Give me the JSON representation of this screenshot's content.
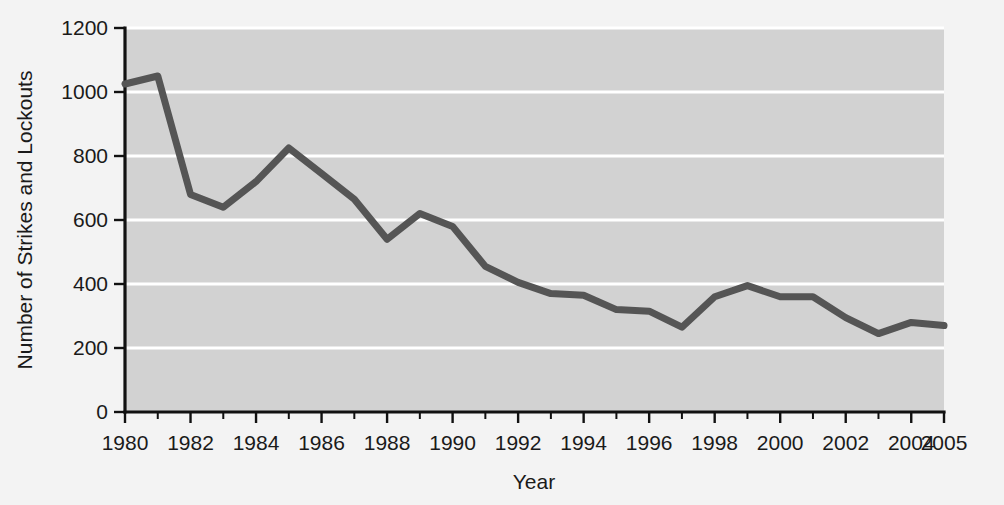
{
  "figure": {
    "background_color": "#f3f3f3",
    "plot_background_color": "#d2d2d2",
    "gridline_color": "#ffffff",
    "axis_color": "#111111",
    "line_color": "#555555"
  },
  "chart_data": {
    "type": "line",
    "title": "",
    "xlabel": "Year",
    "ylabel": "Number of Strikes and Lockouts",
    "xlim": [
      1980,
      2005
    ],
    "ylim": [
      0,
      1200
    ],
    "grid": true,
    "grid_axis": "y",
    "legend": false,
    "ytick_labels": [
      "0",
      "200",
      "400",
      "600",
      "800",
      "1000",
      "1200"
    ],
    "yticks": [
      0,
      200,
      400,
      600,
      800,
      1000,
      1200
    ],
    "xtick_labels": [
      "1980",
      "1982",
      "1984",
      "1986",
      "1988",
      "1990",
      "1992",
      "1994",
      "1996",
      "1998",
      "2000",
      "2002",
      "2004",
      "2005"
    ],
    "xticks": [
      1980,
      1982,
      1984,
      1986,
      1988,
      1990,
      1992,
      1994,
      1996,
      1998,
      2000,
      2002,
      2004,
      2005
    ],
    "x": [
      1980,
      1981,
      1982,
      1983,
      1984,
      1985,
      1986,
      1987,
      1988,
      1989,
      1990,
      1991,
      1992,
      1993,
      1994,
      1995,
      1996,
      1997,
      1998,
      1999,
      2000,
      2001,
      2002,
      2003,
      2004,
      2005
    ],
    "values": [
      1025,
      1050,
      680,
      640,
      720,
      825,
      745,
      665,
      540,
      620,
      580,
      455,
      405,
      370,
      365,
      320,
      315,
      265,
      360,
      395,
      360,
      360,
      295,
      245,
      280,
      270
    ],
    "series": [
      {
        "name": "Number of Strikes and Lockouts",
        "color": "#555555",
        "values": [
          1025,
          1050,
          680,
          640,
          720,
          825,
          745,
          665,
          540,
          620,
          580,
          455,
          405,
          370,
          365,
          320,
          315,
          265,
          360,
          395,
          360,
          360,
          295,
          245,
          280,
          270
        ]
      }
    ]
  }
}
